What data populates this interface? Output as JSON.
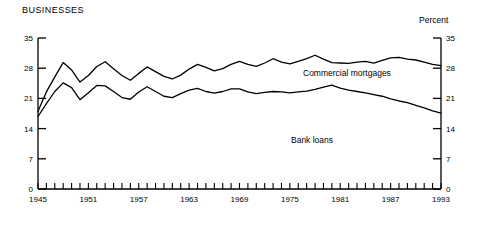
{
  "chart_data": {
    "type": "line",
    "title": "BUSINESSES",
    "xlabel": "",
    "ylabel": "Percent",
    "ylim": [
      0,
      35
    ],
    "xlim": [
      1945,
      1993
    ],
    "grid": false,
    "legend_position": "inline-annotation",
    "y_ticks": [
      0,
      7,
      14,
      21,
      28,
      35
    ],
    "y_ticks_right": [
      0,
      7,
      14,
      21,
      28,
      35
    ],
    "x_ticks_labeled": [
      1945,
      1951,
      1957,
      1963,
      1969,
      1975,
      1981,
      1987,
      1993
    ],
    "x_tick_interval_years": 1,
    "annotations": [
      {
        "text": "Commercial mortgages",
        "x": 1971,
        "y": 25.5
      },
      {
        "text": "Bank loans",
        "x": 1969,
        "y": 11.5
      },
      {
        "text": "Percent",
        "x": 1993,
        "y": 36.5
      }
    ],
    "x": [
      1945,
      1946,
      1947,
      1948,
      1949,
      1950,
      1951,
      1952,
      1953,
      1954,
      1955,
      1956,
      1957,
      1958,
      1959,
      1960,
      1961,
      1962,
      1963,
      1964,
      1965,
      1966,
      1967,
      1968,
      1969,
      1970,
      1971,
      1972,
      1973,
      1974,
      1975,
      1976,
      1977,
      1978,
      1979,
      1980,
      1981,
      1982,
      1983,
      1984,
      1985,
      1986,
      1987,
      1988,
      1989,
      1990,
      1991,
      1992,
      1993
    ],
    "series": [
      {
        "name": "Commercial mortgages",
        "values": [
          18.0,
          22.5,
          26.0,
          29.3,
          27.6,
          24.8,
          26.3,
          28.4,
          29.5,
          27.9,
          26.3,
          25.2,
          26.8,
          28.3,
          27.2,
          26.1,
          25.5,
          26.4,
          27.8,
          28.9,
          28.2,
          27.4,
          27.9,
          28.9,
          29.6,
          28.9,
          28.4,
          29.2,
          30.2,
          29.4,
          29.0,
          29.6,
          30.2,
          31.0,
          30.1,
          29.3,
          29.2,
          29.1,
          29.4,
          29.6,
          29.2,
          29.8,
          30.4,
          30.5,
          30.1,
          29.9,
          29.4,
          28.9,
          28.6
        ]
      },
      {
        "name": "Bank loans",
        "values": [
          16.8,
          19.8,
          22.6,
          24.6,
          23.5,
          20.7,
          22.3,
          24.0,
          23.9,
          22.6,
          21.2,
          20.8,
          22.5,
          23.7,
          22.6,
          21.5,
          21.2,
          22.1,
          22.9,
          23.3,
          22.6,
          22.2,
          22.6,
          23.2,
          23.2,
          22.5,
          22.1,
          22.4,
          22.6,
          22.5,
          22.3,
          22.5,
          22.7,
          23.1,
          23.6,
          24.1,
          23.4,
          22.9,
          22.6,
          22.3,
          21.9,
          21.5,
          20.9,
          20.4,
          20.0,
          19.4,
          18.8,
          18.1,
          17.6
        ]
      }
    ]
  }
}
